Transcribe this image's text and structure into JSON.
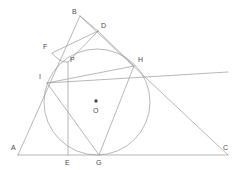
{
  "figure": {
    "type": "geometry-diagram",
    "width": 241,
    "height": 170,
    "background_color": "#ffffff",
    "stroke_color": "#9a9a9a",
    "label_color": "#4a4a4a",
    "label_font_size_px": 7
  },
  "circle": {
    "name": "incircle",
    "center_label": "O",
    "center_x": 97,
    "center_y": 102,
    "radius": 53,
    "center_dot_x": 96,
    "center_dot_y": 101
  },
  "points": [
    {
      "label": "A",
      "x": 18,
      "y": 155,
      "label_x": 11,
      "label_y": 144
    },
    {
      "label": "B",
      "x": 80,
      "y": 16,
      "label_x": 72,
      "label_y": 8
    },
    {
      "label": "C",
      "x": 228,
      "y": 155,
      "label_x": 223,
      "label_y": 144
    },
    {
      "label": "D",
      "x": 98,
      "y": 31,
      "label_x": 101,
      "label_y": 22
    },
    {
      "label": "E",
      "x": 68,
      "y": 155,
      "label_x": 65,
      "label_y": 159
    },
    {
      "label": "F",
      "x": 52,
      "y": 53,
      "label_x": 43,
      "label_y": 43
    },
    {
      "label": "G",
      "x": 99,
      "y": 155,
      "label_x": 96,
      "label_y": 159
    },
    {
      "label": "H",
      "x": 134,
      "y": 66,
      "label_x": 138,
      "label_y": 56
    },
    {
      "label": "I",
      "x": 47,
      "y": 83,
      "label_x": 39,
      "label_y": 73
    },
    {
      "label": "P",
      "x": 68,
      "y": 62,
      "label_x": 70,
      "label_y": 56
    },
    {
      "label": "O",
      "x": 97,
      "y": 102,
      "label_x": 93,
      "label_y": 107
    }
  ],
  "segments": [
    {
      "name": "side-AB",
      "x1": 18,
      "y1": 155,
      "x2": 80,
      "y2": 16
    },
    {
      "name": "side-AC",
      "x1": 18,
      "y1": 155,
      "x2": 228,
      "y2": 155
    },
    {
      "name": "side-BC",
      "x1": 80,
      "y1": 16,
      "x2": 228,
      "y2": 155
    },
    {
      "name": "segment-BD",
      "x1": 80,
      "y1": 16,
      "x2": 98,
      "y2": 31
    },
    {
      "name": "segment-DF",
      "x1": 98,
      "y1": 31,
      "x2": 52,
      "y2": 53
    },
    {
      "name": "segment-DP",
      "x1": 98,
      "y1": 31,
      "x2": 68,
      "y2": 62
    },
    {
      "name": "segment-DH",
      "x1": 98,
      "y1": 31,
      "x2": 134,
      "y2": 66
    },
    {
      "name": "segment-PE",
      "x1": 68,
      "y1": 62,
      "x2": 68,
      "y2": 155
    },
    {
      "name": "segment-IH",
      "x1": 47,
      "y1": 83,
      "x2": 134,
      "y2": 66
    },
    {
      "name": "segment-IG",
      "x1": 47,
      "y1": 83,
      "x2": 99,
      "y2": 155
    },
    {
      "name": "segment-GH",
      "x1": 99,
      "y1": 155,
      "x2": 134,
      "y2": 66
    },
    {
      "name": "segment-IC",
      "x1": 47,
      "y1": 83,
      "x2": 228,
      "y2": 72
    }
  ],
  "arcs": [
    {
      "name": "arc-F-to-P",
      "d": "M 52 53 Q 60 63 68 62"
    }
  ]
}
